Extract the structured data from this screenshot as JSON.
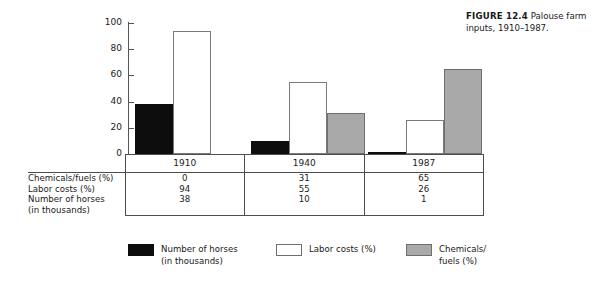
{
  "figure": {
    "label": "FIGURE 12.4",
    "caption": "Palouse farm inputs, 1910–1987."
  },
  "chart_data": {
    "type": "bar",
    "title": "Palouse farm inputs, 1910–1987.",
    "xlabel": "",
    "ylabel": "",
    "ylim": [
      0,
      100
    ],
    "yticks": [
      0,
      20,
      40,
      60,
      80,
      100
    ],
    "grid": false,
    "legend_position": "bottom",
    "categories": [
      "1910",
      "1940",
      "1987"
    ],
    "series": [
      {
        "name": "Number of horses (in thousands)",
        "color": "#0d0d0d",
        "values": [
          38,
          10,
          1
        ]
      },
      {
        "name": "Labor costs (%)",
        "color": "#ffffff",
        "values": [
          94,
          55,
          26
        ]
      },
      {
        "name": "Chemicals/fuels (%)",
        "color": "#a9a9a9",
        "values": [
          0,
          31,
          65
        ]
      }
    ]
  },
  "table": {
    "year_headers": [
      "1910",
      "1940",
      "1987"
    ],
    "rows": [
      {
        "label": "Chemicals/fuels (%)",
        "values": [
          "0",
          "31",
          "65"
        ]
      },
      {
        "label": "Labor costs (%)",
        "values": [
          "94",
          "55",
          "26"
        ]
      },
      {
        "label": "Number of horses",
        "label_line2": "(in thousands)",
        "values": [
          "38",
          "10",
          "1"
        ]
      }
    ]
  },
  "legend": {
    "items": [
      {
        "swatch": "black",
        "line1": "Number of horses",
        "line2": "(in thousands)"
      },
      {
        "swatch": "white",
        "line1": "Labor costs (%)",
        "line2": ""
      },
      {
        "swatch": "gray",
        "line1": "Chemicals/",
        "line2": "fuels (%)"
      }
    ]
  },
  "axis": {
    "tick_100": "100",
    "tick_80": "80",
    "tick_60": "60",
    "tick_40": "40",
    "tick_20": "20",
    "tick_0": "0"
  }
}
